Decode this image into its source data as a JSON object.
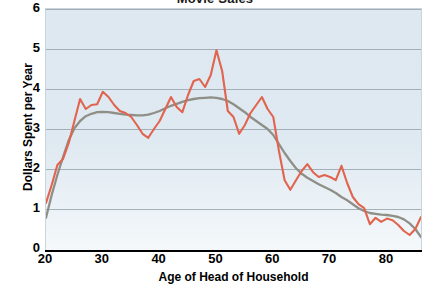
{
  "chart_title": "Movie Sales",
  "axes": {
    "x_title": "Age of Head of Household",
    "y_title": "Dollars Spent per Year",
    "x_ticks": [
      "20",
      "30",
      "40",
      "50",
      "60",
      "70",
      "80"
    ],
    "y_ticks": [
      "0",
      "1",
      "2",
      "3",
      "4",
      "5",
      "6"
    ]
  },
  "colors": {
    "raw_line": "#e1644f",
    "smooth_line": "#8f8f87",
    "plot_background_top": "#dde8f1",
    "plot_background_bottom": "#f4f8fb",
    "gridline": "#8d9ba3",
    "axis": "#000000"
  },
  "chart_data": {
    "type": "line",
    "title": "Movie Sales",
    "xlabel": "Age of Head of Household",
    "ylabel": "Dollars Spent per Year",
    "xlim": [
      20,
      86
    ],
    "ylim": [
      0,
      6
    ],
    "grid": true,
    "legend": "none",
    "xticks": [
      20,
      30,
      40,
      50,
      60,
      70,
      80
    ],
    "yticks": [
      0,
      1,
      2,
      3,
      4,
      5,
      6
    ],
    "x": [
      20,
      21,
      22,
      23,
      24,
      25,
      26,
      27,
      28,
      29,
      30,
      31,
      32,
      33,
      34,
      35,
      36,
      37,
      38,
      39,
      40,
      41,
      42,
      43,
      44,
      45,
      46,
      47,
      48,
      49,
      50,
      51,
      52,
      53,
      54,
      55,
      56,
      57,
      58,
      59,
      60,
      61,
      62,
      63,
      64,
      65,
      66,
      67,
      68,
      69,
      70,
      71,
      72,
      73,
      74,
      75,
      76,
      77,
      78,
      79,
      80,
      81,
      82,
      83,
      84,
      85,
      86
    ],
    "series": [
      {
        "name": "Dollars spent per year (observed)",
        "color": "#e1644f",
        "values": [
          1.15,
          1.6,
          2.1,
          2.25,
          2.65,
          3.2,
          3.75,
          3.5,
          3.6,
          3.62,
          3.93,
          3.8,
          3.6,
          3.45,
          3.4,
          3.3,
          3.1,
          2.88,
          2.78,
          3.0,
          3.2,
          3.5,
          3.8,
          3.55,
          3.42,
          3.85,
          4.2,
          4.25,
          4.05,
          4.35,
          4.97,
          4.45,
          3.45,
          3.3,
          2.88,
          3.1,
          3.4,
          3.6,
          3.8,
          3.5,
          3.3,
          2.45,
          1.72,
          1.48,
          1.72,
          1.95,
          2.12,
          1.92,
          1.8,
          1.85,
          1.8,
          1.72,
          2.08,
          1.65,
          1.3,
          1.12,
          1.02,
          0.62,
          0.78,
          0.68,
          0.76,
          0.72,
          0.6,
          0.45,
          0.35,
          0.5,
          0.8
        ]
      },
      {
        "name": "Dollars spent per year (smoothed trend)",
        "color": "#8f8f87",
        "values": [
          0.78,
          1.35,
          1.85,
          2.3,
          2.72,
          3.02,
          3.2,
          3.32,
          3.38,
          3.42,
          3.43,
          3.42,
          3.4,
          3.38,
          3.36,
          3.35,
          3.34,
          3.34,
          3.36,
          3.4,
          3.45,
          3.52,
          3.58,
          3.63,
          3.68,
          3.72,
          3.75,
          3.77,
          3.78,
          3.79,
          3.78,
          3.75,
          3.7,
          3.62,
          3.52,
          3.42,
          3.3,
          3.2,
          3.1,
          3.0,
          2.85,
          2.62,
          2.4,
          2.2,
          2.02,
          1.88,
          1.78,
          1.7,
          1.62,
          1.55,
          1.48,
          1.4,
          1.3,
          1.22,
          1.12,
          1.02,
          0.95,
          0.9,
          0.88,
          0.86,
          0.85,
          0.83,
          0.8,
          0.74,
          0.64,
          0.5,
          0.3
        ]
      }
    ]
  }
}
